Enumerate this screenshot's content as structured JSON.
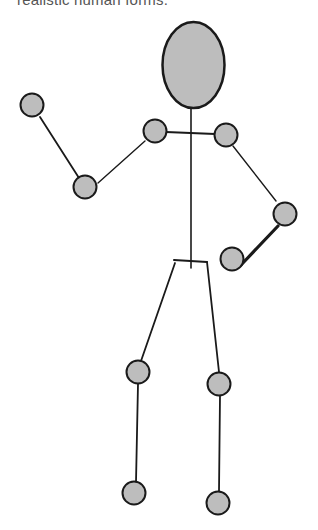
{
  "caption": "realistic human forms.",
  "colors": {
    "joint_fill": "#bdbdbd",
    "stroke": "#1a1a1a",
    "background": "#ffffff",
    "caption": "#555555"
  },
  "figure": {
    "head": {
      "cx": 193.5,
      "cy": 65,
      "rx": 31,
      "ry": 43
    },
    "joints": {
      "left_hand": [
        32,
        105
      ],
      "left_elbow": [
        85,
        187
      ],
      "left_shoulder": [
        155,
        131
      ],
      "right_shoulder": [
        226,
        135
      ],
      "right_elbow": [
        285,
        214
      ],
      "right_hand": [
        232,
        259
      ],
      "left_knee": [
        138,
        372
      ],
      "left_foot": [
        134,
        493
      ],
      "right_knee": [
        219,
        384
      ],
      "right_foot": [
        218,
        503
      ]
    },
    "joint_radius": 11.5
  }
}
